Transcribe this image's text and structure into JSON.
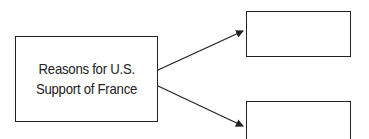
{
  "diagram": {
    "main_box": {
      "lines": [
        "Reasons for U.S.",
        "Support of France"
      ]
    },
    "top_box": {
      "text": ""
    },
    "bottom_box": {
      "text": ""
    },
    "arrows": [
      {
        "from": "main_box",
        "to": "top_box"
      },
      {
        "from": "main_box",
        "to": "bottom_box"
      }
    ],
    "colors": {
      "stroke": "#222222",
      "background": "#ffffff"
    }
  }
}
